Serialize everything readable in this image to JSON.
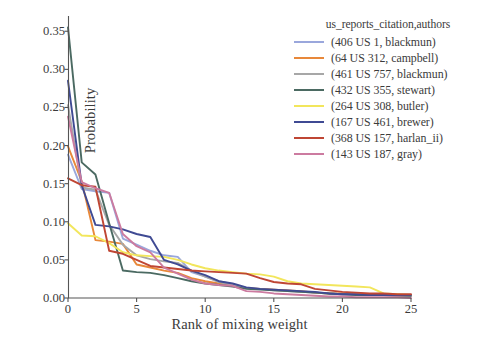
{
  "chart_data": {
    "type": "line",
    "title": "",
    "xlabel": "Rank of mixing weight",
    "ylabel": "Probability",
    "xlim": [
      0,
      25
    ],
    "ylim": [
      0.0,
      0.37
    ],
    "xticks": [
      "0",
      "5",
      "10",
      "15",
      "20",
      "25"
    ],
    "xtick_values": [
      0,
      5,
      10,
      15,
      20,
      25
    ],
    "yticks": [
      "0.00",
      "0.05",
      "0.10",
      "0.15",
      "0.20",
      "0.25",
      "0.30",
      "0.35"
    ],
    "ytick_values": [
      0.0,
      0.05,
      0.1,
      0.15,
      0.2,
      0.25,
      0.3,
      0.35
    ],
    "grid": false,
    "legend_position": "upper right",
    "legend_title": "us_reports_citation,authors",
    "x": [
      0,
      1,
      2,
      3,
      4,
      5,
      6,
      7,
      8,
      9,
      10,
      11,
      12,
      13,
      14,
      15,
      16,
      17,
      18,
      19,
      20,
      21,
      22,
      23,
      24,
      25
    ],
    "series": [
      {
        "name": "(406 US 1, blackmun)",
        "color": "#9aa7dc",
        "values": [
          0.188,
          0.143,
          0.14,
          0.138,
          0.078,
          0.07,
          0.062,
          0.056,
          0.054,
          0.034,
          0.028,
          0.022,
          0.018,
          0.013,
          0.012,
          0.011,
          0.01,
          0.008,
          0.007,
          0.006,
          0.005,
          0.005,
          0.004,
          0.004,
          0.004,
          0.004
        ]
      },
      {
        "name": "(64 US 312, campbell)",
        "color": "#e8883a",
        "values": [
          0.199,
          0.153,
          0.076,
          0.074,
          0.071,
          0.044,
          0.04,
          0.036,
          0.033,
          0.026,
          0.022,
          0.019,
          0.016,
          0.013,
          0.012,
          0.011,
          0.01,
          0.009,
          0.007,
          0.006,
          0.006,
          0.005,
          0.005,
          0.005,
          0.004,
          0.004
        ]
      },
      {
        "name": "(461 US 757, blackmun)",
        "color": "#a7a7a7",
        "values": [
          0.253,
          0.145,
          0.142,
          0.096,
          0.07,
          0.056,
          0.051,
          0.048,
          0.046,
          0.036,
          0.028,
          0.021,
          0.017,
          0.013,
          0.012,
          0.01,
          0.009,
          0.008,
          0.007,
          0.006,
          0.005,
          0.005,
          0.004,
          0.004,
          0.003,
          0.003
        ]
      },
      {
        "name": "(432 US 355, stewart)",
        "color": "#4b6a62",
        "values": [
          0.355,
          0.178,
          0.162,
          0.098,
          0.036,
          0.034,
          0.033,
          0.03,
          0.026,
          0.022,
          0.019,
          0.017,
          0.015,
          0.012,
          0.011,
          0.01,
          0.009,
          0.008,
          0.007,
          0.006,
          0.005,
          0.004,
          0.004,
          0.004,
          0.003,
          0.003
        ]
      },
      {
        "name": "(264 US 308, butler)",
        "color": "#f2e65c",
        "values": [
          0.098,
          0.082,
          0.081,
          0.072,
          0.06,
          0.056,
          0.055,
          0.054,
          0.05,
          0.044,
          0.039,
          0.036,
          0.034,
          0.032,
          0.031,
          0.028,
          0.022,
          0.019,
          0.018,
          0.017,
          0.016,
          0.015,
          0.014,
          0.006,
          0.005,
          0.004
        ]
      },
      {
        "name": "(167 US 461, brewer)",
        "color": "#3f4a93",
        "values": [
          0.285,
          0.148,
          0.096,
          0.094,
          0.09,
          0.084,
          0.08,
          0.05,
          0.044,
          0.036,
          0.03,
          0.022,
          0.019,
          0.014,
          0.012,
          0.011,
          0.01,
          0.009,
          0.008,
          0.006,
          0.005,
          0.005,
          0.004,
          0.004,
          0.004,
          0.004
        ]
      },
      {
        "name": "(368 US 157, harlan_ii)",
        "color": "#bf4634",
        "values": [
          0.157,
          0.148,
          0.146,
          0.062,
          0.058,
          0.05,
          0.042,
          0.04,
          0.038,
          0.036,
          0.035,
          0.034,
          0.033,
          0.032,
          0.026,
          0.021,
          0.019,
          0.018,
          0.012,
          0.01,
          0.008,
          0.007,
          0.006,
          0.006,
          0.005,
          0.005
        ]
      },
      {
        "name": "(143 US 187, gray)",
        "color": "#cc7ba0",
        "values": [
          0.238,
          0.152,
          0.144,
          0.138,
          0.084,
          0.068,
          0.06,
          0.04,
          0.032,
          0.024,
          0.019,
          0.017,
          0.016,
          0.009,
          0.008,
          0.006,
          0.005,
          0.004,
          0.003,
          0.002,
          0.002,
          0.001,
          0.001,
          0.001,
          0.001,
          0.0
        ]
      }
    ]
  }
}
